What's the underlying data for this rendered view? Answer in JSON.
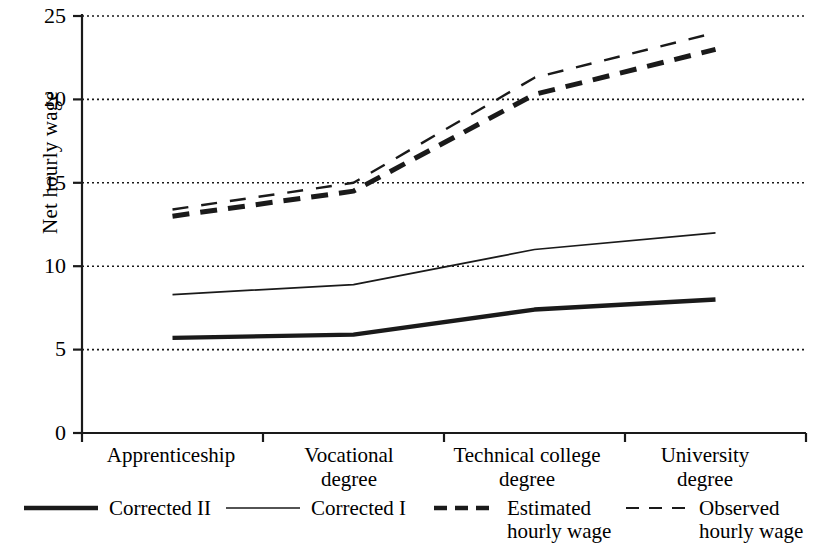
{
  "chart_data": {
    "type": "line",
    "title": "",
    "xlabel": "",
    "ylabel": "Net hourly wage",
    "categories": [
      "Apprenticeship",
      "Vocational\ndegree",
      "Technical college\ndegree",
      "University\ndegree"
    ],
    "ylim": [
      0,
      25
    ],
    "yticks": [
      0,
      5,
      10,
      15,
      20,
      25
    ],
    "ytick_labels": [
      "0",
      "5",
      "10",
      "15",
      "20",
      "25"
    ],
    "grid": "horizontal-dotted",
    "legend_position": "bottom",
    "series": [
      {
        "name": "Corrected II",
        "style": "solid",
        "width": "thick",
        "color": "#1a1a1a",
        "values": [
          5.7,
          5.9,
          7.4,
          8.0
        ]
      },
      {
        "name": "Corrected I",
        "style": "solid",
        "width": "thin",
        "color": "#1a1a1a",
        "values": [
          8.3,
          8.9,
          11.0,
          12.0
        ]
      },
      {
        "name": "Estimated\nhourly wage",
        "style": "dashed",
        "width": "thick",
        "color": "#1a1a1a",
        "values": [
          13.0,
          14.5,
          20.3,
          23.0
        ]
      },
      {
        "name": "Observed\nhourly wage",
        "style": "dashed",
        "width": "thin",
        "color": "#1a1a1a",
        "values": [
          13.4,
          15.0,
          21.3,
          24.0
        ]
      }
    ]
  },
  "axis": {
    "y_label": "Net hourly wage",
    "y_tick_0": "0",
    "y_tick_1": "5",
    "y_tick_2": "10",
    "y_tick_3": "15",
    "y_tick_4": "20",
    "y_tick_5": "25",
    "x_tick_0": "Apprenticeship",
    "x_tick_1": "Vocational\ndegree",
    "x_tick_2": "Technical college\ndegree",
    "x_tick_3": "University\ndegree"
  },
  "legend": {
    "item_0": "Corrected II",
    "item_1": "Corrected I",
    "item_2": "Estimated\nhourly wage",
    "item_3": "Observed\nhourly wage"
  }
}
